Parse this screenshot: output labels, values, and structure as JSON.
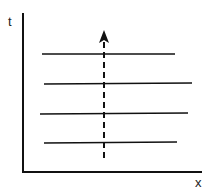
{
  "diagram": {
    "axes": {
      "x_label": "x",
      "y_label": "t"
    },
    "horizontal_lines": [
      {
        "y": 54,
        "x1": 42,
        "x2": 175
      },
      {
        "y": 84,
        "x1": 44,
        "x2": 192
      },
      {
        "y": 113,
        "x1": 40,
        "x2": 188
      },
      {
        "y": 143,
        "x1": 44,
        "x2": 177
      }
    ],
    "dashed_arrow": {
      "x": 104,
      "y_start": 158,
      "y_end": 31,
      "direction": "up"
    },
    "colors": {
      "stroke": "#111111",
      "background": "#ffffff"
    }
  }
}
